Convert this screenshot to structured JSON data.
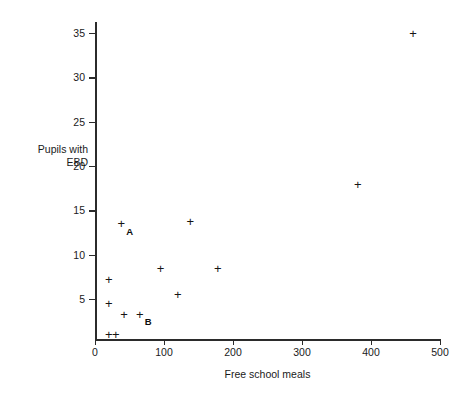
{
  "chart_data": {
    "type": "scatter",
    "title": "",
    "xlabel": "Free school meals",
    "ylabel": "Pupils with\nEBD",
    "ylabel_line1": "Pupils with",
    "ylabel_line2": "EBD",
    "xlim": [
      0,
      500
    ],
    "ylim": [
      0,
      37
    ],
    "xticks": [
      0,
      100,
      200,
      300,
      400,
      500
    ],
    "yticks": [
      5,
      10,
      15,
      20,
      25,
      30,
      35
    ],
    "grid": false,
    "legend": null,
    "marker": "plus",
    "marker_color": "#151515",
    "points": [
      {
        "x": 20,
        "y": 1.0,
        "label": ""
      },
      {
        "x": 30,
        "y": 1.0,
        "label": ""
      },
      {
        "x": 20,
        "y": 4.5,
        "label": ""
      },
      {
        "x": 20,
        "y": 7.2,
        "label": ""
      },
      {
        "x": 42,
        "y": 3.3,
        "label": ""
      },
      {
        "x": 65,
        "y": 3.3,
        "label": "B"
      },
      {
        "x": 38,
        "y": 13.5,
        "label": "A"
      },
      {
        "x": 95,
        "y": 8.4,
        "label": ""
      },
      {
        "x": 120,
        "y": 5.5,
        "label": ""
      },
      {
        "x": 138,
        "y": 13.7,
        "label": ""
      },
      {
        "x": 178,
        "y": 8.4,
        "label": ""
      },
      {
        "x": 381,
        "y": 17.9,
        "label": ""
      },
      {
        "x": 461,
        "y": 35.0,
        "label": ""
      }
    ],
    "annotations": [
      {
        "text": "A",
        "refers_to_point": {
          "x": 38,
          "y": 13.5
        }
      },
      {
        "text": "B",
        "refers_to_point": {
          "x": 65,
          "y": 3.3
        }
      }
    ]
  }
}
